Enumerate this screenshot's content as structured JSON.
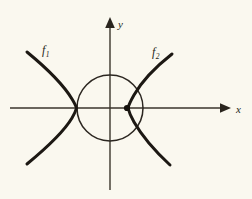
{
  "figure": {
    "background_color": "#faf8ef",
    "ink_color": "#1c1813",
    "width": 252,
    "height": 199
  },
  "axes": {
    "x_label": "x",
    "y_label": "y",
    "x_axis_name": "horizontal-axis",
    "y_axis_name": "vertical-axis",
    "x_arrow_icon": "arrow-right-icon",
    "y_arrow_icon": "arrow-up-icon",
    "origin": {
      "x": 110,
      "y": 108
    },
    "x_axis_start": {
      "x": 10,
      "y": 108
    },
    "x_axis_end": {
      "x": 228,
      "y": 108
    },
    "y_axis_start": {
      "x": 110,
      "y": 190
    },
    "y_axis_end": {
      "x": 110,
      "y": 20
    }
  },
  "circle": {
    "name": "unit-circle",
    "center_x": 110,
    "center_y": 108,
    "radius": 33,
    "stroke_color": "#2b2620"
  },
  "curves": [
    {
      "id": "f1",
      "label": "f",
      "subscript": "1",
      "name": "left-hyperbola-branch",
      "label_x": 42,
      "label_y": 54,
      "vertex": {
        "x": 77,
        "y": 108
      },
      "path": "M 27 52 C 44 66, 63 84, 72 99 C 75 104, 76 106, 76.5 108 C 76 110, 75 113, 72 118 C 63 133, 44 150, 27 164"
    },
    {
      "id": "f2",
      "label": "f",
      "subscript": "2",
      "name": "right-hyperbola-branch",
      "label_x": 152,
      "label_y": 56,
      "vertex": {
        "x": 127,
        "y": 108
      },
      "path": "M 172 54 C 158 65, 142 81, 134 95 C 130 102, 128.5 106, 128 108 C 128.5 110, 130 115, 134 122 C 142 136, 156 152, 170 165"
    }
  ],
  "vertex_marker": {
    "name": "intersection-point-marker",
    "x": 127,
    "y": 108,
    "radius": 3.1,
    "color": "#15110d"
  }
}
